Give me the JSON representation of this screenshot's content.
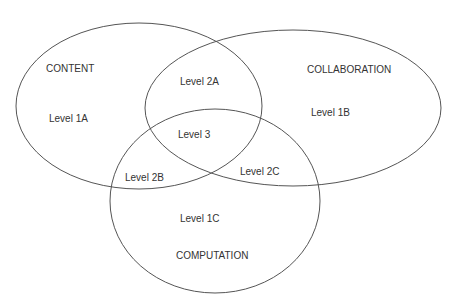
{
  "diagram": {
    "type": "venn",
    "sets": [
      {
        "id": "content",
        "name": "CONTENT",
        "level_label": "Level 1A",
        "cx": 139,
        "cy": 106,
        "rx": 123,
        "ry": 83
      },
      {
        "id": "collaboration",
        "name": "COLLABORATION",
        "level_label": "Level 1B",
        "cx": 293,
        "cy": 108,
        "rx": 148,
        "ry": 78
      },
      {
        "id": "computation",
        "name": "COMPUTATION",
        "level_label": "Level 1C",
        "cx": 215,
        "cy": 201,
        "rx": 105,
        "ry": 92
      }
    ],
    "intersections": [
      {
        "id": "content-collaboration",
        "label": "Level 2A"
      },
      {
        "id": "content-computation",
        "label": "Level 2B"
      },
      {
        "id": "collaboration-computation",
        "label": "Level 2C"
      },
      {
        "id": "all-three",
        "label": "Level 3"
      }
    ],
    "stroke_color": "#555555",
    "text_color": "#333333"
  }
}
